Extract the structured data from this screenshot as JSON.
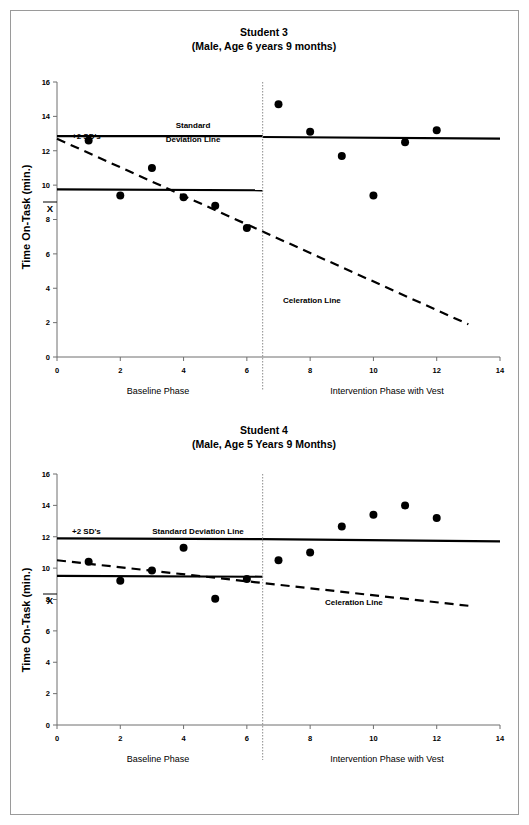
{
  "page": {
    "background_color": "#ffffff",
    "border_color": "#9a9a9a",
    "ink_color": "#000000"
  },
  "charts": [
    {
      "id": "student-3",
      "title": "Student 3",
      "subtitle": "(Male, Age 6 years 9 months)",
      "ylabel": "Time On-Task (min.)",
      "annotations": {
        "sd_label": "+2 SD's",
        "sd_line_label_line1": "Standard",
        "sd_line_label_line2": "Deviation Line",
        "sd_line_label": "Standard Deviation Line",
        "mean_symbol": "X",
        "celeration_label": "Celeration Line"
      },
      "phases": [
        {
          "name": "Baseline Phase",
          "center_x": 3.2
        },
        {
          "name": "Intervention Phase with Vest",
          "center_x": 10.2
        }
      ],
      "phase_divider_x": 6.5
    },
    {
      "id": "student-4",
      "title": "Student 4",
      "subtitle": "(Male, Age 5 Years 9 Months)",
      "ylabel": "Time On-Task (min.)",
      "annotations": {
        "sd_label": "+2 SD's",
        "sd_line_label_line1": "Standard Deviation Line",
        "sd_line_label_line2": "",
        "sd_line_label": "Standard Deviation Line",
        "mean_symbol": "X",
        "celeration_label": "Celeration Line"
      },
      "phases": [
        {
          "name": "Baseline Phase",
          "center_x": 3.2
        },
        {
          "name": "Intervention Phase with Vest",
          "center_x": 10.2
        }
      ],
      "phase_divider_x": 6.5
    }
  ],
  "chart_data": [
    {
      "type": "scatter",
      "title": "Student 3",
      "subtitle": "(Male, Age 6 years 9 months)",
      "xlabel": "",
      "ylabel": "Time On-Task (min.)",
      "xlim": [
        0,
        14
      ],
      "ylim": [
        0,
        16
      ],
      "xticks": [
        0,
        2,
        4,
        6,
        8,
        10,
        12,
        14
      ],
      "yticks": [
        0,
        2,
        4,
        6,
        8,
        10,
        12,
        14,
        16
      ],
      "grid": false,
      "legend": "none",
      "series": [
        {
          "name": "Baseline Phase",
          "x": [
            1,
            2,
            3,
            4,
            5,
            6
          ],
          "y": [
            12.6,
            9.4,
            11.0,
            9.3,
            8.8,
            7.5
          ]
        },
        {
          "name": "Intervention Phase with Vest",
          "x": [
            7,
            8,
            9,
            10,
            11,
            12
          ],
          "y": [
            14.7,
            13.1,
            11.7,
            9.4,
            12.5,
            13.2
          ]
        }
      ],
      "reference_lines": [
        {
          "name": "Standard Deviation Line (baseline segment)",
          "style": "solid",
          "x": [
            0,
            6.5
          ],
          "y": [
            12.85,
            12.85
          ]
        },
        {
          "name": "Standard Deviation Line (intervention segment)",
          "style": "solid",
          "x": [
            6.5,
            14
          ],
          "y": [
            12.8,
            12.7
          ]
        },
        {
          "name": "Mean Line (X-bar)",
          "style": "solid",
          "x": [
            0,
            6.5
          ],
          "y": [
            9.75,
            9.7
          ]
        },
        {
          "name": "Celeration Line",
          "style": "dashed",
          "x": [
            0,
            13
          ],
          "y": [
            12.7,
            1.9
          ]
        }
      ],
      "phase_divider_x": 6.5,
      "annotations": [
        {
          "text": "+2 SD's",
          "x": 0.6,
          "y": 13.9
        },
        {
          "text": "Standard",
          "x": 4.3,
          "y": 14.2
        },
        {
          "text": "Deviation Line",
          "x": 4.3,
          "y": 13.4
        },
        {
          "text": "Celeration Line",
          "x": 8.1,
          "y": 4.2
        }
      ]
    },
    {
      "type": "scatter",
      "title": "Student 4",
      "subtitle": "(Male, Age 5 Years 9 Months)",
      "xlabel": "",
      "ylabel": "Time On-Task (min.)",
      "xlim": [
        0,
        14
      ],
      "ylim": [
        0,
        16
      ],
      "xticks": [
        0,
        2,
        4,
        6,
        8,
        10,
        12,
        14
      ],
      "yticks": [
        0,
        2,
        4,
        6,
        8,
        10,
        12,
        14,
        16
      ],
      "grid": false,
      "legend": "none",
      "series": [
        {
          "name": "Baseline Phase",
          "x": [
            1,
            2,
            3,
            4,
            5,
            6
          ],
          "y": [
            10.4,
            9.2,
            9.85,
            11.3,
            8.05,
            9.3
          ]
        },
        {
          "name": "Intervention Phase with Vest",
          "x": [
            7,
            8,
            9,
            10,
            11,
            12
          ],
          "y": [
            10.5,
            11.0,
            12.65,
            13.4,
            14.0,
            13.2
          ]
        }
      ],
      "reference_lines": [
        {
          "name": "Standard Deviation Line (baseline segment)",
          "style": "solid",
          "x": [
            0,
            6.5
          ],
          "y": [
            11.9,
            11.85
          ]
        },
        {
          "name": "Standard Deviation Line (intervention segment)",
          "style": "solid",
          "x": [
            6.5,
            14
          ],
          "y": [
            11.85,
            11.7
          ]
        },
        {
          "name": "Mean Line (X-bar)",
          "style": "solid",
          "x": [
            0,
            6.5
          ],
          "y": [
            9.5,
            9.45
          ]
        },
        {
          "name": "Celeration Line",
          "style": "dashed",
          "x": [
            0,
            13
          ],
          "y": [
            10.5,
            7.6
          ]
        }
      ],
      "phase_divider_x": 6.5,
      "annotations": [
        {
          "text": "+2 SD's",
          "x": 0.7,
          "y": 12.25
        },
        {
          "text": "Standard Deviation Line",
          "x": 4.3,
          "y": 12.3
        },
        {
          "text": "Celeration Line",
          "x": 9.3,
          "y": 8.1
        }
      ]
    }
  ]
}
